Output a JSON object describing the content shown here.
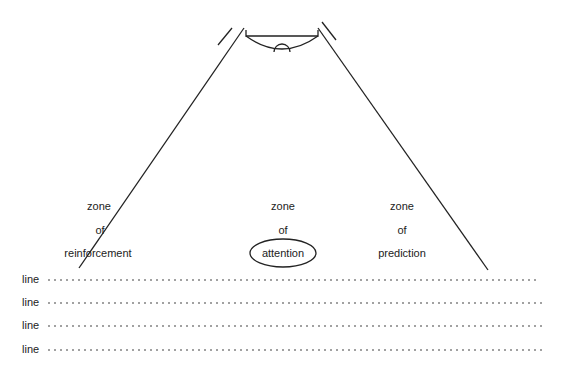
{
  "diagram": {
    "zones": [
      {
        "id": "reinforcement",
        "words": [
          "zone",
          "of",
          "reinforcement"
        ]
      },
      {
        "id": "attention",
        "words": [
          "zone",
          "of",
          "attention"
        ]
      },
      {
        "id": "prediction",
        "words": [
          "zone",
          "of",
          "prediction"
        ]
      }
    ],
    "lines": [
      "line",
      "line",
      "line",
      "line"
    ],
    "colors": {
      "stroke": "#222222",
      "background": "#ffffff"
    }
  }
}
